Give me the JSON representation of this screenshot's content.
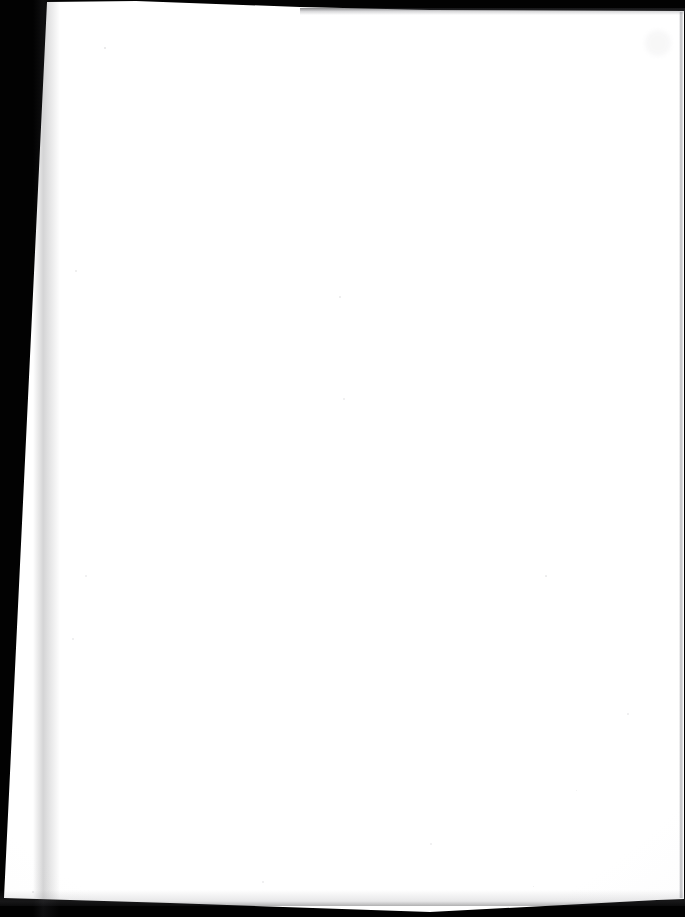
{
  "document": {
    "kind": "scanned-page",
    "content_state": "blank",
    "visible_text": "",
    "page_side": "verso",
    "notes": "No printed or handwritten text is visible anywhere on the scanned sheet."
  },
  "canvas": {
    "width": 685,
    "height": 917,
    "background_color": "#020202"
  },
  "sheet": {
    "color": "#ffffff",
    "corners": {
      "top_left": [
        47,
        2
      ],
      "top_right": [
        684,
        11
      ],
      "bottom_right": [
        684,
        899
      ],
      "bottom_left": [
        4,
        898
      ]
    },
    "edge_shadow_color": "#8a8a90"
  },
  "borders": {
    "left_wedge": {
      "color": "#020202",
      "width_at_top": 48,
      "width_at_bottom": 3
    },
    "top_band": {
      "color": "#020202",
      "height_right": 11,
      "height_left": 2
    },
    "bottom_band": {
      "color": "#020202",
      "starts_left_y": 898,
      "starts_mid_y": 912
    },
    "bottom_right_corner_triangle": {
      "color": "#020202",
      "apex_x": 655,
      "apex_y": 900
    }
  },
  "artifacts": {
    "specks": [
      {
        "x": 104,
        "y": 47,
        "size": 2.0,
        "opacity": 0.16
      },
      {
        "x": 75,
        "y": 270,
        "size": 1.6,
        "opacity": 0.12
      },
      {
        "x": 27,
        "y": 267,
        "size": 1.4,
        "opacity": 0.11
      },
      {
        "x": 339,
        "y": 296,
        "size": 1.8,
        "opacity": 0.13
      },
      {
        "x": 343,
        "y": 398,
        "size": 1.5,
        "opacity": 0.11
      },
      {
        "x": 545,
        "y": 575,
        "size": 1.7,
        "opacity": 0.12
      },
      {
        "x": 85,
        "y": 575,
        "size": 1.5,
        "opacity": 0.1
      },
      {
        "x": 72,
        "y": 638,
        "size": 1.5,
        "opacity": 0.11
      },
      {
        "x": 627,
        "y": 713,
        "size": 1.8,
        "opacity": 0.12
      },
      {
        "x": 262,
        "y": 881,
        "size": 1.5,
        "opacity": 0.11
      },
      {
        "x": 32,
        "y": 891,
        "size": 1.8,
        "opacity": 0.14
      },
      {
        "x": 576,
        "y": 790,
        "size": 1.4,
        "opacity": 0.1
      },
      {
        "x": 430,
        "y": 843,
        "size": 1.5,
        "opacity": 0.1
      },
      {
        "x": 533,
        "y": 886,
        "size": 1.4,
        "opacity": 0.1
      }
    ],
    "smudge": {
      "x": 645,
      "y": 30,
      "width": 26,
      "height": 26,
      "opacity": 0.07,
      "color": "#9a9aa0"
    }
  }
}
